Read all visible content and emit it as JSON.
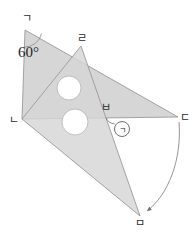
{
  "figure": {
    "background_color": "#ffffff",
    "fill_color": "#d6d6d6",
    "overlap_fill_color": "#cfcfcf",
    "stroke_color": "#9a9a9a",
    "label_color": "#2b2b2b",
    "vertices": {
      "g": {
        "label": "ㄱ",
        "x": 25,
        "y": 30
      },
      "n": {
        "label": "ㄴ",
        "x": 22,
        "y": 119
      },
      "d": {
        "label": "ㄷ",
        "x": 178,
        "y": 117
      },
      "r": {
        "label": "ㄹ",
        "x": 81,
        "y": 46
      },
      "m": {
        "label": "ㅁ",
        "x": 140,
        "y": 216
      },
      "b": {
        "label": "ㅂ",
        "x": 106,
        "y": 110
      }
    },
    "angles": [
      {
        "name": "angle-at-g",
        "label": "60°",
        "value": 60,
        "unit": "degrees",
        "vertex": "ㄱ",
        "x": 20,
        "y": 53
      },
      {
        "name": "angle-marked-circled",
        "label": "ㄱ",
        "vertex": "ㅂ",
        "x": 120,
        "y": 128,
        "circled": true
      }
    ],
    "holes": [
      {
        "name": "hole-upper",
        "cx": 69,
        "cy": 88,
        "r": 12
      },
      {
        "name": "hole-lower",
        "cx": 75,
        "cy": 122,
        "r": 13
      }
    ],
    "rotation_arc": {
      "name": "rotation-arc",
      "from": "ㄷ",
      "to": "ㅁ",
      "direction": "clockwise"
    }
  }
}
